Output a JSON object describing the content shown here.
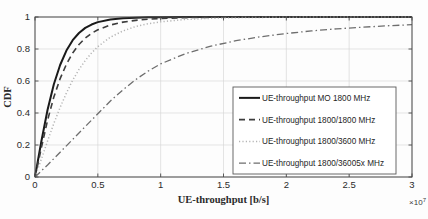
{
  "chart_data": {
    "type": "line",
    "title": "",
    "xlabel": "UE-throughput [b/s]",
    "ylabel": "CDF",
    "x_exponent": "×10",
    "x_exponent_power": "7",
    "xlim": [
      0,
      3
    ],
    "ylim": [
      0,
      1
    ],
    "xticks": [
      "0",
      "0.5",
      "1",
      "1.5",
      "2",
      "2.5",
      "3"
    ],
    "xtick_values": [
      0,
      0.5,
      1,
      1.5,
      2,
      2.5,
      3
    ],
    "yticks": [
      "0",
      "0.2",
      "0.4",
      "0.6",
      "0.8",
      "1"
    ],
    "ytick_values": [
      0,
      0.2,
      0.4,
      0.6,
      0.8,
      1
    ],
    "grid": true,
    "legend_position": "lower-right",
    "x_unit_note": "x values are in units of 1e7 b/s",
    "series": [
      {
        "name": "UE-throughput MO 1800 MHz",
        "style": "solid",
        "color": "#1a1a1a",
        "width": 2.0,
        "dash": "",
        "x": [
          0,
          0.05,
          0.1,
          0.15,
          0.2,
          0.25,
          0.3,
          0.35,
          0.4,
          0.45,
          0.5,
          0.6,
          0.7,
          0.8,
          0.9,
          1.0,
          1.2,
          1.5,
          2.0,
          2.5,
          3.0
        ],
        "y": [
          0,
          0.22,
          0.42,
          0.58,
          0.7,
          0.79,
          0.855,
          0.9,
          0.932,
          0.953,
          0.968,
          0.985,
          0.992,
          0.996,
          0.998,
          0.999,
          1.0,
          1.0,
          1.0,
          1.0,
          1.0
        ]
      },
      {
        "name": "UE-throughput 1800/1800 MHz",
        "style": "dashed",
        "color": "#3d3d3d",
        "width": 1.6,
        "dash": "6,4",
        "x": [
          0,
          0.05,
          0.1,
          0.15,
          0.2,
          0.25,
          0.3,
          0.35,
          0.4,
          0.45,
          0.5,
          0.6,
          0.7,
          0.8,
          0.9,
          1.0,
          1.2,
          1.5,
          2.0,
          2.5,
          3.0
        ],
        "y": [
          0,
          0.18,
          0.355,
          0.5,
          0.615,
          0.705,
          0.775,
          0.828,
          0.868,
          0.898,
          0.92,
          0.95,
          0.968,
          0.979,
          0.986,
          0.991,
          0.996,
          0.999,
          1.0,
          1.0,
          1.0
        ]
      },
      {
        "name": "UE-throughput 1800/3600 MHz",
        "style": "dotted",
        "color": "#b4b4b4",
        "width": 1.5,
        "dash": "1.2,2.2",
        "x": [
          0,
          0.05,
          0.1,
          0.15,
          0.2,
          0.25,
          0.3,
          0.35,
          0.4,
          0.45,
          0.5,
          0.6,
          0.7,
          0.8,
          0.9,
          1.0,
          1.2,
          1.5,
          2.0,
          2.5,
          3.0
        ],
        "y": [
          0,
          0.11,
          0.225,
          0.335,
          0.435,
          0.525,
          0.605,
          0.672,
          0.728,
          0.775,
          0.815,
          0.874,
          0.913,
          0.94,
          0.958,
          0.97,
          0.985,
          0.995,
          0.999,
          1.0,
          1.0
        ]
      },
      {
        "name": "UE-throughput 1800/36005x MHz",
        "style": "dash-dot",
        "color": "#6e6e6e",
        "width": 1.3,
        "dash": "7,3,1.5,3",
        "x": [
          0,
          0.1,
          0.2,
          0.3,
          0.4,
          0.5,
          0.6,
          0.7,
          0.8,
          0.9,
          1.0,
          1.2,
          1.4,
          1.6,
          1.8,
          2.0,
          2.2,
          2.4,
          2.6,
          2.8,
          3.0
        ],
        "y": [
          0,
          0.075,
          0.155,
          0.235,
          0.315,
          0.395,
          0.475,
          0.545,
          0.608,
          0.662,
          0.707,
          0.772,
          0.818,
          0.852,
          0.877,
          0.897,
          0.913,
          0.926,
          0.936,
          0.945,
          0.952
        ]
      }
    ]
  },
  "legend": {
    "items": [
      {
        "label": "UE-throughput MO 1800 MHz"
      },
      {
        "label": "UE-throughput 1800/1800 MHz"
      },
      {
        "label": "UE-throughput 1800/3600 MHz"
      },
      {
        "label": "UE-throughput 1800/36005x MHz"
      }
    ]
  }
}
